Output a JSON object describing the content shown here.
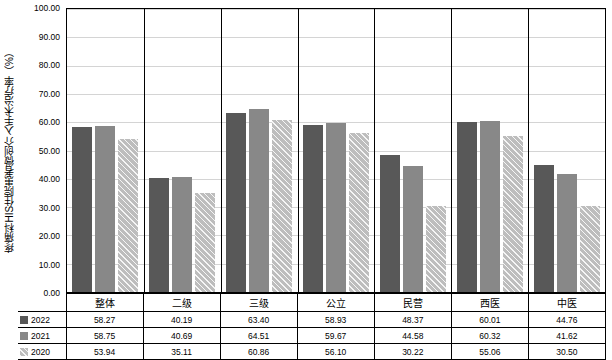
{
  "chart_data": {
    "type": "bar",
    "title": "",
    "xlabel": "",
    "ylabel": "疼痛科HIS住院患者微创介入手术治疗率（%）",
    "ylim": [
      0,
      100
    ],
    "ytick_step": 10,
    "ytick_labels": [
      "0.00",
      "10.00",
      "20.00",
      "30.00",
      "40.00",
      "50.00",
      "60.00",
      "70.00",
      "80.00",
      "90.00",
      "100.00"
    ],
    "grid": true,
    "legend_position": "bottom-table",
    "categories": [
      "整体",
      "二级",
      "三级",
      "公立",
      "民营",
      "西医",
      "中医"
    ],
    "series": [
      {
        "name": "2022",
        "color": "#585858",
        "values": [
          58.27,
          40.19,
          63.4,
          58.93,
          48.37,
          60.01,
          44.76
        ],
        "labels": [
          "58.27",
          "40.19",
          "63.40",
          "58.93",
          "48.37",
          "60.01",
          "44.76"
        ]
      },
      {
        "name": "2021",
        "color": "#888888",
        "values": [
          58.75,
          40.69,
          64.51,
          59.67,
          44.58,
          60.32,
          41.62
        ],
        "labels": [
          "58.75",
          "40.69",
          "64.51",
          "59.67",
          "44.58",
          "60.32",
          "41.62"
        ]
      },
      {
        "name": "2020",
        "color": "#bdbdbd",
        "values": [
          53.94,
          35.11,
          60.86,
          56.1,
          30.22,
          55.06,
          30.5
        ],
        "labels": [
          "53.94",
          "35.11",
          "60.86",
          "56.10",
          "30.22",
          "55.06",
          "30.50"
        ]
      }
    ]
  }
}
